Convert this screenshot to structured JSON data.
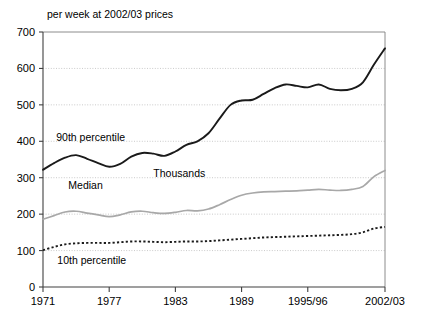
{
  "chart_data": {
    "type": "line",
    "title": "per week at 2002/03 prices",
    "xlabel": "",
    "ylabel": "",
    "ylim": [
      0,
      700
    ],
    "ytick_values": [
      0,
      100,
      200,
      300,
      400,
      500,
      600,
      700
    ],
    "ytick_labels": [
      "0",
      "100",
      "200",
      "300",
      "400",
      "500",
      "600",
      "700"
    ],
    "xtick_labels": [
      "1971",
      "1977",
      "1983",
      "1989",
      "1995/96",
      "2002/03"
    ],
    "xtick_values": [
      1971,
      1977,
      1983,
      1989,
      1995,
      2002
    ],
    "grid": true,
    "legend_position": "inline-annotations",
    "annotations": [
      {
        "text": "90th percentile",
        "x": 1972.2,
        "y": 400
      },
      {
        "text": "Thousands",
        "x": 1981.0,
        "y": 302
      },
      {
        "text": "Median",
        "x": 1973.3,
        "y": 270
      },
      {
        "text": "10th percentile",
        "x": 1972.3,
        "y": 62
      }
    ],
    "x": [
      1971,
      1972,
      1973,
      1974,
      1975,
      1976,
      1977,
      1978,
      1979,
      1980,
      1981,
      1982,
      1983,
      1984,
      1985,
      1986,
      1987,
      1988,
      1989,
      1990,
      1991,
      1992,
      1993,
      1994,
      1995,
      1996,
      1997,
      1998,
      1999,
      2000,
      2001,
      2002
    ],
    "series": [
      {
        "name": "90th percentile",
        "style": "solid-dark",
        "values": [
          322,
          340,
          355,
          362,
          352,
          340,
          330,
          338,
          358,
          368,
          366,
          360,
          372,
          390,
          400,
          422,
          462,
          500,
          512,
          514,
          530,
          546,
          556,
          552,
          548,
          556,
          544,
          540,
          544,
          562,
          566,
          576
        ]
      },
      {
        "name": "Median",
        "style": "solid-grey",
        "values": [
          186,
          196,
          206,
          208,
          203,
          198,
          193,
          198,
          206,
          208,
          204,
          202,
          205,
          210,
          209,
          214,
          226,
          240,
          252,
          258,
          261,
          262,
          263,
          264,
          266,
          268,
          266,
          265,
          268,
          276,
          286,
          296
        ]
      },
      {
        "name": "10th percentile",
        "style": "dashed-dark",
        "values": [
          101,
          110,
          117,
          120,
          121,
          121,
          121,
          123,
          125,
          125,
          124,
          123,
          124,
          125,
          125,
          126,
          128,
          130,
          132,
          134,
          136,
          137,
          138,
          139,
          140,
          141,
          142,
          143,
          145,
          150,
          156,
          160
        ]
      }
    ],
    "series_tail": {
      "note": "curve extends to 2002/03 endpoint",
      "p90_end": 655,
      "median_end": 320,
      "p10_end": 165
    }
  }
}
